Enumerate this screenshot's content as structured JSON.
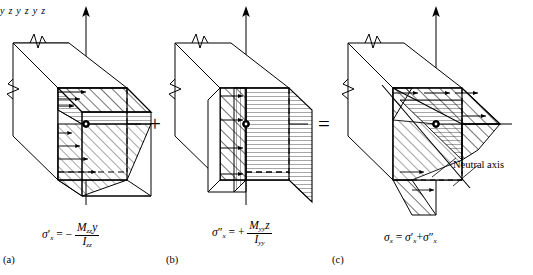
{
  "figure": {
    "background_color": "#ffffff",
    "line_color": "#000000",
    "operators": {
      "plus": "+",
      "equals": "="
    },
    "annotations": {
      "neutral_axis": "Neutral axis"
    }
  },
  "panels": [
    {
      "id": "a",
      "tag": "(a)",
      "axis_y": "y",
      "axis_z": "z",
      "formula": {
        "lhs_symbol": "σ",
        "lhs_sub": "x",
        "lhs_prime": "′",
        "equals": "=",
        "sign": "−",
        "numerator_moment": "M",
        "numerator_moment_sub": "zz",
        "numerator_coord": "y",
        "denominator_inertia": "I",
        "denominator_inertia_sub": "zz",
        "plain_text": "σ′x = − Mzz y / Izz"
      }
    },
    {
      "id": "b",
      "tag": "(b)",
      "axis_y": "y",
      "axis_z": "z",
      "formula": {
        "lhs_symbol": "σ",
        "lhs_sub": "x",
        "lhs_prime": "″",
        "equals": "=",
        "sign": "+",
        "numerator_moment": "M",
        "numerator_moment_sub": "yy",
        "numerator_coord": "z",
        "denominator_inertia": "I",
        "denominator_inertia_sub": "yy",
        "plain_text": "σ″x = + Myy z / Iyy"
      }
    },
    {
      "id": "c",
      "tag": "(c)",
      "axis_y": "y",
      "axis_z": "z",
      "formula": {
        "lhs_symbol": "σ",
        "lhs_sub": "x",
        "equals": "=",
        "term1_symbol": "σ",
        "term1_sub": "x",
        "term1_prime": "′",
        "operator": "+",
        "term2_symbol": "σ",
        "term2_sub": "x",
        "term2_prime": "″",
        "plain_text": "σx = σ′x + σ″x"
      }
    }
  ]
}
